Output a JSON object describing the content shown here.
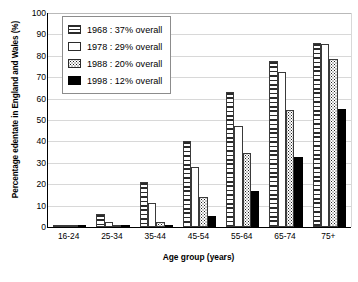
{
  "chart_data": {
    "type": "bar",
    "title": "",
    "xlabel": "Age group (years)",
    "ylabel": "Percentage edentate in England and Wales (%)",
    "ylim": [
      0,
      100
    ],
    "ytick_step": 10,
    "yticks": [
      100,
      90,
      80,
      70,
      60,
      50,
      40,
      30,
      20,
      10,
      0
    ],
    "grid": true,
    "legend_position": "upper-left-inside",
    "categories": [
      "16-24",
      "25-34",
      "35-44",
      "45-54",
      "55-64",
      "65-74",
      "75+"
    ],
    "series": [
      {
        "name": "1968 : 37% overall",
        "year": "1968",
        "overall": "37% overall",
        "pattern": "horizontal-stripes",
        "values": [
          0.8,
          6.3,
          21.2,
          40.3,
          63.0,
          77.6,
          86.2
        ]
      },
      {
        "name": "1978 : 29% overall",
        "year": "1978",
        "overall": "29% overall",
        "pattern": "white",
        "values": [
          0.2,
          2.5,
          11.3,
          28.2,
          47.0,
          72.5,
          85.5
        ]
      },
      {
        "name": "1988 : 20% overall",
        "year": "1988",
        "overall": "20% overall",
        "pattern": "dots",
        "values": [
          0.1,
          0.6,
          2.2,
          14.0,
          34.7,
          54.7,
          78.3
        ]
      },
      {
        "name": "1998 : 12% overall",
        "year": "1998",
        "overall": "12% overall",
        "pattern": "solid-black",
        "values": [
          0.0,
          0.3,
          0.6,
          5.2,
          16.9,
          32.6,
          55.3
        ]
      }
    ]
  },
  "axes": {
    "y_title": "Percentage edentate in England and Wales (%)",
    "x_title": "Age group (years)"
  },
  "legend": {
    "items": [
      {
        "label": "1968 : 37% overall",
        "pattern": "horizontal-stripes"
      },
      {
        "label": "1978 : 29% overall",
        "pattern": "white"
      },
      {
        "label": "1988 : 20% overall",
        "pattern": "dots"
      },
      {
        "label": "1998 : 12% overall",
        "pattern": "solid-black"
      }
    ]
  },
  "colors": {
    "bar_outline": "#3a3a3a",
    "solid_fill": "#000000",
    "gridline": "#d8d8d8",
    "axis": "#000000",
    "background": "#ffffff"
  }
}
